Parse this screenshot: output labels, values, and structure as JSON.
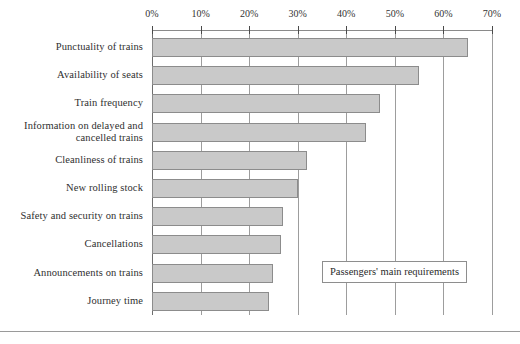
{
  "chart_data": {
    "type": "bar",
    "orientation": "horizontal",
    "title": "",
    "xlabel": "",
    "ylabel": "",
    "xlim": [
      0,
      70
    ],
    "grid": true,
    "legend_position": "inside-lower-right",
    "legend_label": "Passengers' main requirements",
    "tick_labels": [
      "0%",
      "10%",
      "20%",
      "30%",
      "40%",
      "50%",
      "60%",
      "70%"
    ],
    "tick_values": [
      0,
      10,
      20,
      30,
      40,
      50,
      60,
      70
    ],
    "categories": [
      "Punctuality of trains",
      "Availability of seats",
      "Train frequency",
      "Information on delayed and\ncancelled trains",
      "Cleanliness of trains",
      "New rolling stock",
      "Safety and security on trains",
      "Cancellations",
      "Announcements on trains",
      "Journey time"
    ],
    "values": [
      65,
      55,
      47,
      44,
      32,
      30,
      27,
      26.5,
      25,
      24
    ],
    "series": [
      {
        "name": "Passengers' main requirements",
        "values": [
          65,
          55,
          47,
          44,
          32,
          30,
          27,
          26.5,
          25,
          24
        ]
      }
    ]
  },
  "colors": {
    "bar_fill": "#c9c9c9",
    "bar_stroke": "#8c8c8c",
    "gridline": "#9d9d9d",
    "text": "#2b2b2b"
  }
}
